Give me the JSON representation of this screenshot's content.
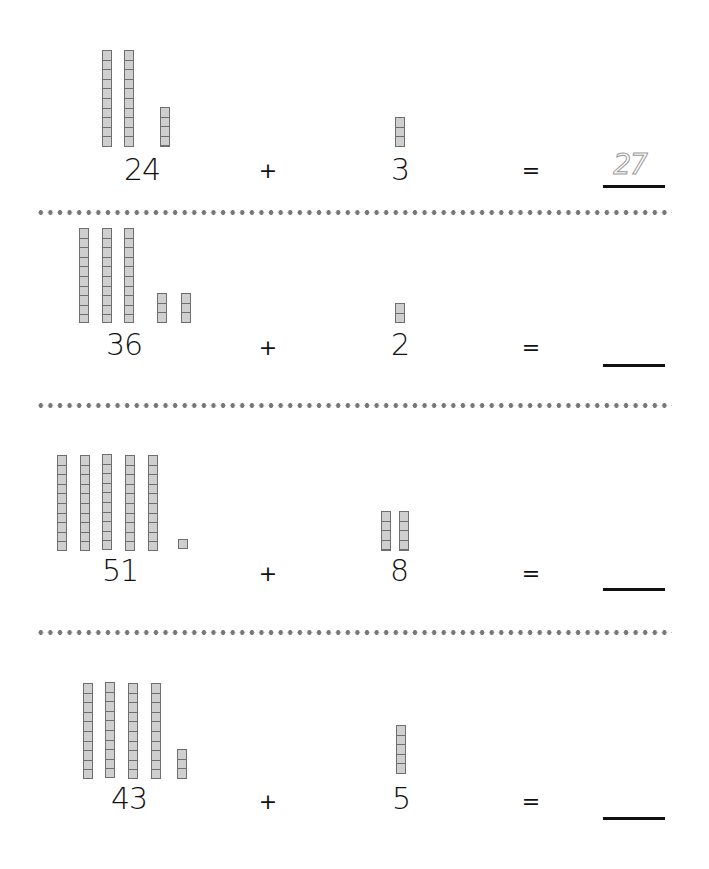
{
  "worksheet": {
    "title": "",
    "colors": {
      "cube_fill": "#cfcfcf",
      "cube_border": "#6e6e6e",
      "dots": "#777777",
      "text": "#111111"
    },
    "problems": [
      {
        "addend1": "24",
        "tens": 2,
        "ones": 4,
        "operator": "+",
        "addend2": "3",
        "addend2_ones": 3,
        "equals": "=",
        "answer": "27",
        "answer_traced": true
      },
      {
        "addend1": "36",
        "tens": 3,
        "ones": 6,
        "operator": "+",
        "addend2": "2",
        "addend2_ones": 2,
        "equals": "=",
        "answer": "",
        "answer_traced": false
      },
      {
        "addend1": "51",
        "tens": 5,
        "ones": 1,
        "operator": "+",
        "addend2": "8",
        "addend2_ones": 8,
        "equals": "=",
        "answer": "",
        "answer_traced": false
      },
      {
        "addend1": "43",
        "tens": 4,
        "ones": 3,
        "operator": "+",
        "addend2": "5",
        "addend2_ones": 5,
        "equals": "=",
        "answer": "",
        "answer_traced": false
      }
    ]
  }
}
